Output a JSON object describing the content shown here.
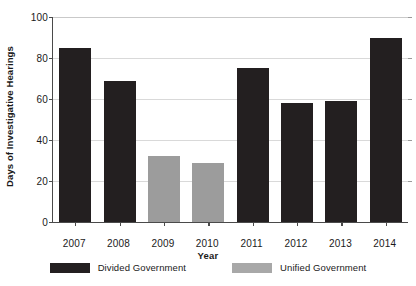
{
  "chart_data": {
    "type": "bar",
    "title": "",
    "xlabel": "Year",
    "ylabel": "Days of Investigative Hearings",
    "categories": [
      "2007",
      "2008",
      "2009",
      "2010",
      "2011",
      "2012",
      "2013",
      "2014"
    ],
    "values": [
      85,
      69,
      32,
      29,
      75,
      58,
      59,
      90
    ],
    "bar_groups": [
      "Divided Government",
      "Divided Government",
      "Unified Government",
      "Unified Government",
      "Divided Government",
      "Divided Government",
      "Divided Government",
      "Divided Government"
    ],
    "series": [
      {
        "name": "Divided Government",
        "color": "#231f20",
        "points": [
          {
            "x": "2007",
            "y": 85
          },
          {
            "x": "2008",
            "y": 69
          },
          {
            "x": "2011",
            "y": 75
          },
          {
            "x": "2012",
            "y": 58
          },
          {
            "x": "2013",
            "y": 59
          },
          {
            "x": "2014",
            "y": 90
          }
        ]
      },
      {
        "name": "Unified Government",
        "color": "#9c9c9c",
        "points": [
          {
            "x": "2009",
            "y": 32
          },
          {
            "x": "2010",
            "y": 29
          }
        ]
      }
    ],
    "ylim": [
      0,
      100
    ],
    "yticks": [
      0,
      20,
      40,
      60,
      80,
      100
    ],
    "ytick_labels": [
      "0",
      "20",
      "40",
      "60",
      "80",
      "100"
    ],
    "grid": true,
    "grid_axis": "y",
    "legend_position": "bottom-center",
    "legend": [
      {
        "label": "Divided Government",
        "color": "#231f20"
      },
      {
        "label": "Unified Government",
        "color": "#a8a8a8"
      }
    ]
  },
  "axes": {
    "y_title": "Days of Investigative Hearings",
    "x_title": "Year"
  },
  "colors": {
    "divided": "#231f20",
    "unified": "#9c9c9c",
    "axis": "#4a4a4a",
    "grid": "#d9d9d9",
    "background": "#ffffff",
    "text": "#1a1a1a"
  }
}
